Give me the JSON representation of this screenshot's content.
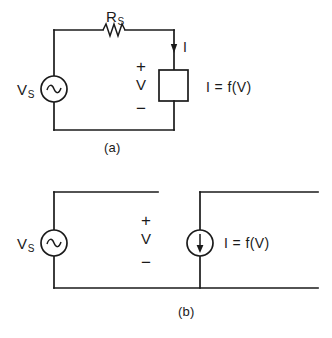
{
  "figure": {
    "background_color": "#ffffff",
    "line_color": "#1a1a1a"
  },
  "diagram_a": {
    "caption": "(a)",
    "source_label": "V",
    "source_subscript": "S",
    "source_symbol": "ac-sine",
    "resistor_label": "R",
    "resistor_subscript": "S",
    "resistor_symbol": "zigzag",
    "current_label": "I",
    "current_arrow_direction": "down",
    "polarity_plus": "+",
    "voltage_label": "V",
    "polarity_minus": "−",
    "load_equation": "I  =  f(V)",
    "load_symbol": "rectangle-block"
  },
  "diagram_b": {
    "caption": "(b)",
    "source_label": "V",
    "source_subscript": "S",
    "source_symbol": "ac-sine",
    "polarity_plus": "+",
    "voltage_label": "V",
    "polarity_minus": "−",
    "current_source_symbol": "current-source-arrow-down",
    "load_equation": "I  =  f(V)"
  }
}
